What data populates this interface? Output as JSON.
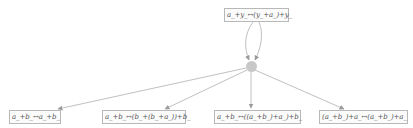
{
  "graph": {
    "top_node": {
      "label": "a_+y_↔(y_+a_)+y_"
    },
    "hub_node": {
      "shape": "circle",
      "color": "#c8c8c8"
    },
    "bottom_nodes": [
      {
        "label": "a_+b_↔a_+b_"
      },
      {
        "label": "a_+b_↔(b_+(b_+a_))+b_"
      },
      {
        "label": "a_+b_↔((a_+b_)+a_)+b_"
      },
      {
        "label": "(a_+b_)+a_↔(a_+b_)+a_"
      }
    ],
    "edges": [
      {
        "from": "top_node",
        "to": "hub_node",
        "count": 2
      },
      {
        "from": "hub_node",
        "to": "bottom_nodes.0"
      },
      {
        "from": "hub_node",
        "to": "bottom_nodes.1"
      },
      {
        "from": "hub_node",
        "to": "bottom_nodes.2"
      },
      {
        "from": "hub_node",
        "to": "bottom_nodes.3"
      }
    ],
    "colors": {
      "edge": "#c0c0c0",
      "arrowhead": "#9a9a9a",
      "box_border": "#b8b8b8",
      "text": "#555555"
    }
  }
}
